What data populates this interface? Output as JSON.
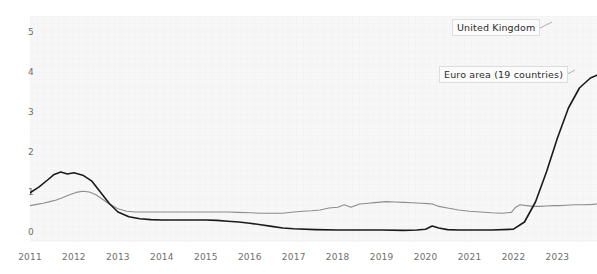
{
  "chart_data": {
    "type": "line",
    "title": "",
    "xlabel": "",
    "ylabel": "",
    "xlim": [
      2011.0,
      2023.9
    ],
    "ylim": [
      -0.25,
      5.4
    ],
    "grid": true,
    "legend_position": "inline-annotations",
    "yticks": [
      "0",
      "1",
      "2",
      "3",
      "4",
      "5"
    ],
    "ytick_values": [
      0,
      1,
      2,
      3,
      4,
      5
    ],
    "xticks": [
      "2011",
      "2012",
      "2013",
      "2014",
      "2015",
      "2016",
      "2017",
      "2018",
      "2019",
      "2020",
      "2021",
      "2022",
      "2023"
    ],
    "xtick_values": [
      2011,
      2012,
      2013,
      2014,
      2015,
      2016,
      2017,
      2018,
      2019,
      2020,
      2021,
      2022,
      2023
    ],
    "series": [
      {
        "name": "United Kingdom",
        "color": "#8d8d8d",
        "label_text": "United Kingdom",
        "x": [
          2011.0,
          2011.15,
          2011.3,
          2011.45,
          2011.6,
          2011.75,
          2011.9,
          2012.05,
          2012.2,
          2012.35,
          2012.5,
          2012.65,
          2012.8,
          2013.0,
          2013.2,
          2013.4,
          2013.6,
          2013.8,
          2014.0,
          2014.25,
          2014.5,
          2014.75,
          2015.0,
          2015.25,
          2015.5,
          2015.75,
          2016.0,
          2016.25,
          2016.5,
          2016.75,
          2017.0,
          2017.2,
          2017.4,
          2017.6,
          2017.8,
          2018.0,
          2018.15,
          2018.3,
          2018.5,
          2018.7,
          2018.9,
          2019.1,
          2019.3,
          2019.5,
          2019.7,
          2019.9,
          2020.05,
          2020.15,
          2020.2,
          2020.3,
          2020.5,
          2020.75,
          2021.0,
          2021.25,
          2021.5,
          2021.75,
          2021.95,
          2022.05,
          2022.15,
          2022.3,
          2022.45,
          2022.6,
          2022.75,
          2022.9,
          2023.05,
          2023.2,
          2023.4,
          2023.6,
          2023.8,
          2023.9
        ],
        "y": [
          0.66,
          0.69,
          0.72,
          0.76,
          0.8,
          0.86,
          0.93,
          0.99,
          1.02,
          1.0,
          0.93,
          0.82,
          0.7,
          0.58,
          0.52,
          0.5,
          0.5,
          0.5,
          0.5,
          0.5,
          0.5,
          0.5,
          0.5,
          0.5,
          0.5,
          0.49,
          0.48,
          0.47,
          0.47,
          0.47,
          0.5,
          0.52,
          0.53,
          0.55,
          0.6,
          0.62,
          0.68,
          0.62,
          0.7,
          0.72,
          0.74,
          0.76,
          0.75,
          0.74,
          0.73,
          0.72,
          0.71,
          0.7,
          0.68,
          0.64,
          0.6,
          0.55,
          0.52,
          0.5,
          0.48,
          0.47,
          0.49,
          0.62,
          0.68,
          0.66,
          0.64,
          0.64,
          0.65,
          0.66,
          0.66,
          0.67,
          0.68,
          0.68,
          0.69,
          0.7
        ]
      },
      {
        "name": "Euro area (19 countries)",
        "color": "#1a1a1a",
        "label_text": "Euro area (19 countries)",
        "x": [
          2011.0,
          2011.2,
          2011.4,
          2011.55,
          2011.7,
          2011.85,
          2012.0,
          2012.2,
          2012.4,
          2012.6,
          2012.8,
          2013.0,
          2013.25,
          2013.5,
          2013.75,
          2014.0,
          2014.25,
          2014.5,
          2014.75,
          2015.0,
          2015.25,
          2015.5,
          2015.75,
          2016.0,
          2016.25,
          2016.5,
          2016.75,
          2017.0,
          2017.5,
          2018.0,
          2018.5,
          2019.0,
          2019.5,
          2019.8,
          2020.0,
          2020.15,
          2020.3,
          2020.5,
          2020.75,
          2021.0,
          2021.5,
          2022.0,
          2022.25,
          2022.5,
          2022.75,
          2023.0,
          2023.25,
          2023.5,
          2023.75,
          2023.9
        ],
        "y": [
          0.98,
          1.12,
          1.3,
          1.44,
          1.5,
          1.45,
          1.48,
          1.42,
          1.28,
          1.0,
          0.72,
          0.5,
          0.38,
          0.33,
          0.31,
          0.3,
          0.3,
          0.3,
          0.3,
          0.3,
          0.29,
          0.27,
          0.25,
          0.22,
          0.18,
          0.14,
          0.1,
          0.08,
          0.06,
          0.05,
          0.05,
          0.05,
          0.04,
          0.05,
          0.07,
          0.15,
          0.1,
          0.06,
          0.05,
          0.05,
          0.05,
          0.07,
          0.25,
          0.75,
          1.5,
          2.35,
          3.1,
          3.6,
          3.85,
          3.92
        ]
      }
    ],
    "annotations": [
      {
        "id": "ann-uk",
        "text": "United Kingdom",
        "attach_x": 2023.35,
        "attach_y": 4.55
      },
      {
        "id": "ann-ea",
        "text": "Euro area (19 countries)",
        "attach_x": 2023.2,
        "attach_y": 3.05
      }
    ]
  }
}
